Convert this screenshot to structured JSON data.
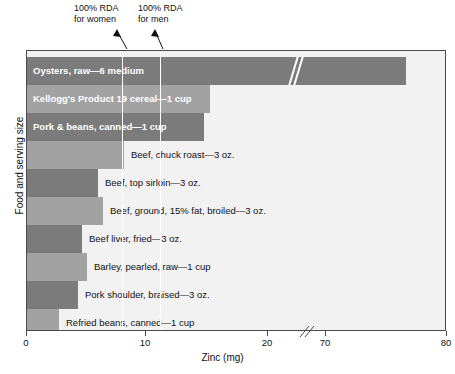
{
  "chart_data": {
    "type": "bar",
    "orientation": "horizontal",
    "title": "",
    "xlabel": "Zinc (mg)",
    "ylabel": "Food and serving size",
    "xlim": [
      0,
      80
    ],
    "axis_break": {
      "from": 22,
      "to": 68,
      "label": "axis-break"
    },
    "grid": false,
    "legend": false,
    "categories": [
      "Oysters, raw—6 medium",
      "Kellogg's Product 19 cereal—1 cup",
      "Pork & beans, canned—1 cup",
      "Beef, chuck roast—3 oz.",
      "Beef, top sirloin—3 oz.",
      "Beef, ground, 15% fat, broiled—3 oz.",
      "Beef liver, fried—3 oz.",
      "Barley, pearled, raw—1 cup",
      "Pork shoulder, braised—3 oz.",
      "Refried beans, canned—1 cup"
    ],
    "values": [
      76.3,
      15.0,
      14.5,
      8.1,
      6.0,
      6.4,
      4.6,
      5.1,
      4.2,
      2.7
    ],
    "annotations": [
      {
        "name": "rda-women",
        "text": "100% RDA for women",
        "value": 8
      },
      {
        "name": "rda-men",
        "text": "100% RDA for men",
        "value": 11
      }
    ],
    "tick_labels": [
      "0",
      "10",
      "20",
      "70",
      "80"
    ],
    "tick_values": [
      0,
      10,
      20,
      70,
      80
    ]
  },
  "annotations": {
    "rda_women": {
      "line1": "100% RDA",
      "line2": "for women"
    },
    "rda_men": {
      "line1": "100% RDA",
      "line2": "for men"
    }
  },
  "axes": {
    "x_title": "Zinc (mg)",
    "y_title": "Food and serving size",
    "ticks": [
      {
        "label": "0",
        "x": 0
      },
      {
        "label": "10",
        "x": 119
      },
      {
        "label": "20",
        "x": 241
      },
      {
        "label": "70",
        "x": 299
      },
      {
        "label": "80",
        "x": 420
      }
    ]
  },
  "bars": [
    {
      "label": "Oysters, raw—6 medium",
      "value": 76.3,
      "shade": "dark",
      "width": 379,
      "inside": true,
      "label_x": 6,
      "broken": true
    },
    {
      "label": "Kellogg's Product 19 cereal—1 cup",
      "value": 15.0,
      "shade": "light",
      "width": 183,
      "inside": true,
      "label_x": 6,
      "broken": false
    },
    {
      "label": "Pork & beans, canned—1 cup",
      "value": 14.5,
      "shade": "dark",
      "width": 177,
      "inside": true,
      "label_x": 6,
      "broken": false
    },
    {
      "label": "Beef, chuck roast—3 oz.",
      "value": 8.1,
      "shade": "light",
      "width": 97,
      "inside": false,
      "label_x": 104,
      "broken": false
    },
    {
      "label": "Beef, top sirloin—3 oz.",
      "value": 6.0,
      "shade": "dark",
      "width": 71,
      "inside": false,
      "label_x": 78,
      "broken": false
    },
    {
      "label": "Beef, ground, 15% fat, broiled—3 oz.",
      "value": 6.4,
      "shade": "light",
      "width": 76,
      "inside": false,
      "label_x": 83,
      "broken": false
    },
    {
      "label": "Beef liver, fried—3 oz.",
      "value": 4.6,
      "shade": "dark",
      "width": 55,
      "inside": false,
      "label_x": 62,
      "broken": false
    },
    {
      "label": "Barley, pearled, raw—1 cup",
      "value": 5.1,
      "shade": "light",
      "width": 60,
      "inside": false,
      "label_x": 67,
      "broken": false
    },
    {
      "label": "Pork shoulder, braised—3 oz.",
      "value": 4.2,
      "shade": "dark",
      "width": 51,
      "inside": false,
      "label_x": 58,
      "broken": false
    },
    {
      "label": "Refried beans, canned—1 cup",
      "value": 2.7,
      "shade": "light",
      "width": 32,
      "inside": false,
      "label_x": 39,
      "broken": false
    }
  ],
  "rda_lines": [
    {
      "name": "rda-line-women",
      "x": 95
    },
    {
      "name": "rda-line-men",
      "x": 133
    }
  ],
  "colors": {
    "bar_dark": "#7b7b7b",
    "bar_light": "#a2a2a2",
    "plot_bg": "#f2f2f2",
    "frame": "#4a4a4a",
    "text": "#111111",
    "inside_label": "#ffffff"
  }
}
